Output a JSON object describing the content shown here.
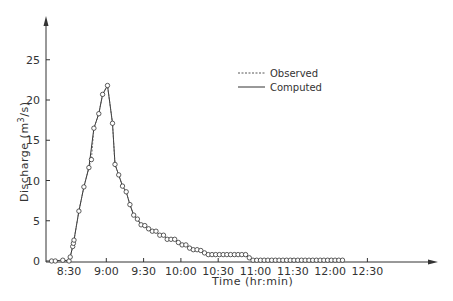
{
  "chart_data": {
    "type": "line",
    "title": "",
    "xlabel": "Time (hr:min)",
    "ylabel": "Discharge (m³/s)",
    "ylabel_parts": {
      "prefix": "Discharge (m",
      "sup": "3",
      "suffix": "/s)"
    },
    "x_tick_labels": [
      "8:30",
      "9:00",
      "9:30",
      "10:00",
      "10:30",
      "11:00",
      "11:30",
      "12:00",
      "12:30"
    ],
    "y_tick_labels": [
      "0",
      "5",
      "10",
      "15",
      "20",
      "25"
    ],
    "y_ticks": [
      0,
      5,
      10,
      15,
      20,
      25
    ],
    "ylim": [
      0,
      29
    ],
    "xlim_minutes_after_8_30": [
      -25,
      250
    ],
    "grid": false,
    "legend_position": "upper-center",
    "legend": [
      {
        "name": "Observed",
        "style": "dashed"
      },
      {
        "name": "Computed",
        "style": "solid"
      }
    ],
    "x_unit": "minutes after 8:30",
    "series": [
      {
        "name": "Observed",
        "style": "dashed-with-circle-markers",
        "x": [
          -14,
          -11,
          -5,
          0,
          1,
          3,
          3.5,
          4,
          8,
          12,
          16,
          18,
          20,
          24,
          27,
          31,
          35,
          37,
          40,
          43,
          46,
          49,
          52,
          55,
          58,
          61,
          64,
          67,
          70,
          73,
          76,
          79,
          82,
          85,
          88,
          91,
          94,
          97,
          100,
          103,
          106,
          109,
          112,
          115,
          118,
          121,
          124,
          127,
          130,
          133,
          136,
          139,
          142,
          145,
          148,
          151,
          154,
          157,
          160,
          163,
          166,
          169,
          172,
          175,
          178,
          181,
          184,
          187,
          190,
          193,
          196,
          199,
          202,
          205,
          208,
          211,
          214,
          217,
          220
        ],
        "y": [
          0,
          0,
          0.1,
          0,
          0.5,
          1.8,
          2.2,
          2.6,
          6.2,
          9.2,
          11.6,
          12.6,
          16.5,
          18.3,
          20.7,
          21.8,
          17.1,
          12.0,
          10.7,
          9.3,
          8.6,
          7.0,
          5.7,
          5.2,
          4.5,
          4.4,
          4.0,
          3.7,
          3.7,
          3.2,
          3.2,
          2.7,
          2.7,
          2.7,
          2.3,
          2.0,
          2.0,
          1.6,
          1.4,
          1.4,
          1.3,
          1.0,
          0.8,
          0.8,
          0.8,
          0.8,
          0.8,
          0.8,
          0.8,
          0.8,
          0.8,
          0.8,
          0.8,
          0.4,
          0.1,
          0.1,
          0.1,
          0.1,
          0.1,
          0.1,
          0.1,
          0.1,
          0.1,
          0.1,
          0.1,
          0.1,
          0.1,
          0.1,
          0.1,
          0.1,
          0.1,
          0.1,
          0.1,
          0.1,
          0.1,
          0.1,
          0.1,
          0.1,
          0.1
        ]
      },
      {
        "name": "Computed",
        "style": "solid",
        "x": [
          -14,
          -5,
          0,
          1,
          3,
          4,
          8,
          12,
          16,
          20,
          24,
          27,
          31,
          35,
          37,
          40,
          43,
          46,
          49,
          52,
          55,
          58,
          61,
          64,
          67,
          70,
          73,
          76,
          79,
          82,
          85,
          88,
          91,
          94,
          97,
          100,
          103,
          106,
          109,
          112,
          115,
          118,
          121,
          124,
          127,
          130,
          133,
          136,
          139,
          142,
          145,
          148,
          151,
          160,
          170,
          180,
          190,
          200,
          210,
          220
        ],
        "y": [
          0,
          0.1,
          0,
          0.5,
          1.8,
          2.6,
          6.2,
          9.2,
          11.6,
          16.5,
          18.3,
          20.7,
          21.8,
          17.1,
          12.0,
          10.7,
          9.3,
          8.6,
          7.0,
          5.7,
          5.2,
          4.5,
          4.4,
          4.0,
          3.7,
          3.7,
          3.2,
          3.2,
          2.7,
          2.7,
          2.7,
          2.3,
          2.0,
          2.0,
          1.6,
          1.4,
          1.4,
          1.3,
          1.0,
          0.8,
          0.8,
          0.8,
          0.8,
          0.8,
          0.8,
          0.8,
          0.8,
          0.8,
          0.8,
          0.8,
          0.4,
          0.1,
          0.1,
          0.1,
          0.1,
          0.1,
          0.1,
          0.1,
          0.1,
          0.1
        ]
      }
    ],
    "peak": {
      "time": "9:11",
      "value": 21.8
    }
  },
  "colors": {
    "line": "#333333",
    "axis": "#333333",
    "marker_fill": "#ffffff",
    "background": "#ffffff"
  }
}
